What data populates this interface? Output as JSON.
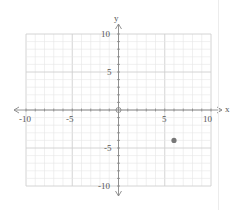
{
  "chart_data": {
    "type": "scatter",
    "title": "",
    "xlabel": "x",
    "ylabel": "y",
    "xlim": [
      -10,
      10
    ],
    "ylim": [
      -10,
      10
    ],
    "grid": true,
    "x_ticks": [
      "-10",
      "-5",
      "5",
      "10"
    ],
    "y_ticks": [
      "10",
      "5",
      "-5",
      "-10"
    ],
    "series": [
      {
        "name": "point",
        "x": [
          6
        ],
        "y": [
          -4
        ]
      }
    ],
    "origin_marker": "open-circle"
  },
  "labels": {
    "x_axis": "x",
    "y_axis": "y",
    "xt_m10": "-10",
    "xt_m5": "-5",
    "xt_5": "5",
    "xt_10": "10",
    "yt_10": "10",
    "yt_5": "5",
    "yt_m5": "-5",
    "yt_m10": "-10"
  },
  "colors": {
    "grid_minor": "#e6e6e6",
    "grid_major": "#cfcfcf",
    "axis": "#888888",
    "point": "#777777"
  }
}
